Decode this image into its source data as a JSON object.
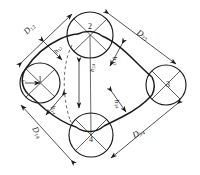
{
  "figure": {
    "kind": "engineering-diagram",
    "background_color": "#ffffff",
    "line_color": "#1a1a1a"
  },
  "pulleys": [
    {
      "id": "pulley-1",
      "label": "1",
      "position": "left",
      "cx": 40,
      "cy": 83,
      "r": 20
    },
    {
      "id": "pulley-2",
      "label": "2",
      "position": "top",
      "cx": 90,
      "cy": 35,
      "r": 23
    },
    {
      "id": "pulley-3",
      "label": "3",
      "position": "right",
      "cx": 166,
      "cy": 85,
      "r": 20
    },
    {
      "id": "pulley-4",
      "label": "4",
      "position": "bottom",
      "cx": 91,
      "cy": 135,
      "r": 22
    }
  ],
  "center_distances": [
    {
      "id": "D12",
      "text": "D",
      "sub": "12",
      "x": 22,
      "y": 30,
      "rotate": -46
    },
    {
      "id": "D23",
      "text": "D",
      "sub": "23",
      "x": 140,
      "y": 28,
      "rotate": 32
    },
    {
      "id": "D34",
      "text": "D",
      "sub": "34",
      "x": 131,
      "y": 132,
      "rotate": -27
    },
    {
      "id": "D14",
      "text": "D",
      "sub": "14",
      "x": 38,
      "y": 125,
      "rotate": 60
    }
  ],
  "offsets": [
    {
      "id": "h12",
      "text": "h",
      "sub": "12",
      "x": 53,
      "y": 51,
      "rotate": -52
    },
    {
      "id": "h23",
      "text": "h",
      "sub": "23",
      "x": 117,
      "y": 56,
      "rotate": 72
    },
    {
      "id": "h34",
      "text": "h",
      "sub": "34",
      "x": 119,
      "y": 99,
      "rotate": 72
    },
    {
      "id": "h14",
      "text": "h",
      "sub": "14",
      "x": 55,
      "y": 105,
      "rotate": 66
    },
    {
      "id": "h24",
      "text": "h",
      "sub": "24",
      "x": 89,
      "y": 72,
      "rotate": -90
    }
  ],
  "radii": [
    {
      "id": "r1",
      "text": "r",
      "sub": "1",
      "x": 22,
      "y": 78
    }
  ]
}
